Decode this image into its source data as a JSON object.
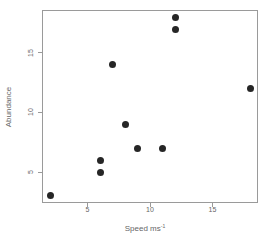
{
  "chart_data": {
    "type": "scatter",
    "title": "",
    "xlabel": "Speed ms",
    "xlabel_superscript": "-1",
    "ylabel": "Abundance",
    "points": [
      {
        "x": 2,
        "y": 3
      },
      {
        "x": 6,
        "y": 5
      },
      {
        "x": 6,
        "y": 6
      },
      {
        "x": 7,
        "y": 14
      },
      {
        "x": 8,
        "y": 9
      },
      {
        "x": 9,
        "y": 7
      },
      {
        "x": 11,
        "y": 7
      },
      {
        "x": 12,
        "y": 17
      },
      {
        "x": 12,
        "y": 18
      },
      {
        "x": 18,
        "y": 12
      }
    ],
    "xticks": [
      "5",
      "10",
      "15"
    ],
    "xtick_values": [
      5,
      10,
      15
    ],
    "yticks": [
      "5",
      "10",
      "15"
    ],
    "ytick_values": [
      5,
      10,
      15
    ],
    "xlim": [
      1.36,
      18.64
    ],
    "ylim": [
      2.4,
      18.6
    ],
    "grid": false,
    "legend": null,
    "point_color": "#262626",
    "axis_color": "#9a9a9a",
    "text_color": "#666666",
    "background_color": "#ffffff"
  }
}
